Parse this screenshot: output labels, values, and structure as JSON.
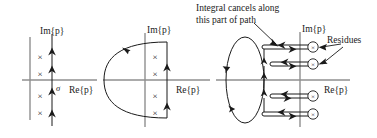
{
  "figure": {
    "panels": [
      {
        "id": "panel-left",
        "name": "original-bromwich-contour",
        "im_axis_label": "Im{p}",
        "re_axis_label": "Re{p}",
        "sigma_label": "σ",
        "pole_marker": "×",
        "pole_count": 4,
        "poles": [
          {
            "re": -0.55,
            "im": 0.72
          },
          {
            "re": -0.55,
            "im": 0.3
          },
          {
            "re": -0.55,
            "im": -0.28
          },
          {
            "re": -0.55,
            "im": -0.7
          }
        ],
        "contour_direction": "upward",
        "arrow_count": 4
      },
      {
        "id": "panel-middle",
        "name": "closed-contour-with-left-semicircle",
        "im_axis_label": "Im{p}",
        "re_axis_label": "Re{p}",
        "pole_marker": "×",
        "pole_count": 4,
        "poles": [
          {
            "re": 0.18,
            "im": 0.72
          },
          {
            "re": 0.18,
            "im": 0.3
          },
          {
            "re": 0.18,
            "im": -0.28
          },
          {
            "re": 0.18,
            "im": -0.7
          }
        ],
        "contour_direction": "counterclockwise",
        "arrow_count": 3
      },
      {
        "id": "panel-right",
        "name": "deformed-contour-around-residues",
        "im_axis_label": "Im{p}",
        "re_axis_label": "Re{p}",
        "pole_marker": "×",
        "pole_count": 4,
        "residue_label": "Residues",
        "cancel_note_line1": "Integral cancels along",
        "cancel_note_line2": "this part of path",
        "branch_count": 4,
        "contour_direction": "counterclockwise"
      }
    ],
    "colors": {
      "axis": "#8f8f8f",
      "contour": "#1a1a1a",
      "text": "#1a1a1a",
      "background": "#ffffff"
    }
  }
}
